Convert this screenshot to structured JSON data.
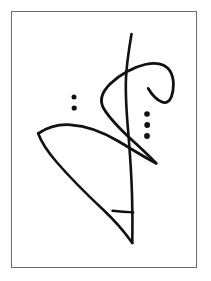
{
  "page": {
    "width": 211,
    "height": 281,
    "background_color": "#ffffff"
  },
  "frame": {
    "border_color": "#6b6b6b",
    "border_width": 1,
    "fill_color": "#ffffff",
    "x": 11,
    "y": 11,
    "width": 186,
    "height": 257
  },
  "artwork": {
    "style": "minimalist calligraphic ink brush strokes",
    "ink_color": "#111111",
    "stroke_count": 4,
    "dot_count": 5,
    "description": "Abstract black brush-stroke composition of intersecting sweeping curves forming a leaf loop at upper right, a lens shape at left, a long vertical S-curve, and two groups of dots",
    "strokes": [
      {
        "name": "vertical-s-curve",
        "label": "Long vertical S-curve",
        "width": 2.6,
        "path": "M 131.5 34 C 129.0 49 126.6 63 126.0 78 C 125.2 96 126.6 114 128.4 134 C 130.0 154 131.4 174 132.0 194 C 132.5 211 132.6 228 132.3 243"
      },
      {
        "name": "leaf-loop-sweep",
        "label": "Right leaf loop with long sweeping tail",
        "width": 2.8,
        "path": "M 156.2 163.2 C 150.0 157 142.0 149 133.0 141 C 121.0 130 110.0 119 104.0 109 C 98.5 100 102.0 92 110.0 84 C 120.0 74 134.0 67 145.0 64.5 C 156.0 62 165.5 64 170.0 71 C 174.8 78.5 173.8 90 171.5 96.5 C 169.6 101.8 166.0 103.6 162.0 102.0 C 157.0 100.0 151.5 94.0 148.2 88.5"
      },
      {
        "name": "left-lens-upper",
        "label": "Left lens upper sweeping arc",
        "width": 2.8,
        "path": "M 38.2 133.5 C 47.0 127.5 58.0 124.0 70.5 124.8 C 86.0 125.8 103.0 132.0 118.0 141.0 C 131.0 148.8 144.0 157.0 156.0 163.2"
      },
      {
        "name": "left-lens-lower",
        "label": "Left lens lower arc into bottom point",
        "width": 2.6,
        "path": "M 38.2 133.5 C 41.0 141.5 47.5 151.5 57.0 162.5 C 70.0 177.5 88.0 195.5 104.0 210.5 C 116.0 221.8 126.0 234.0 132.3 243"
      },
      {
        "name": "bottom-crossbar",
        "label": "Short bottom crossbar stroke",
        "width": 2.4,
        "path": "M 112.5 210.8 C 119.0 211.6 126.0 212.2 133.2 212.4"
      }
    ],
    "dot_groups": [
      {
        "name": "left-dot-pair",
        "label": "Left pair of dots",
        "count": 2,
        "dots": [
          {
            "cx": 74.0,
            "cy": 97.0,
            "r": 2.5
          },
          {
            "cx": 74.2,
            "cy": 108.0,
            "r": 2.6
          }
        ]
      },
      {
        "name": "right-dot-triple",
        "label": "Right column of three dots",
        "count": 3,
        "dots": [
          {
            "cx": 147.0,
            "cy": 114.0,
            "r": 2.8
          },
          {
            "cx": 147.2,
            "cy": 125.0,
            "r": 2.9
          },
          {
            "cx": 147.0,
            "cy": 136.0,
            "r": 2.9
          }
        ]
      }
    ]
  }
}
